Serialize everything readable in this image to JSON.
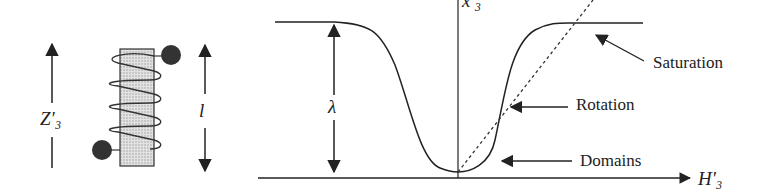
{
  "solenoid": {
    "axis_label": "Z'₃",
    "length_label": "l"
  },
  "curve": {
    "vertical_axis_label": "x'₃",
    "horizontal_axis_label": "H'₃",
    "amplitude_label": "λ",
    "annotations": {
      "saturation": "Saturation",
      "rotation": "Rotation",
      "domains": "Domains"
    }
  },
  "colors": {
    "ink": "#222222",
    "core_fill": "#d4d4d4",
    "background": "#ffffff"
  }
}
